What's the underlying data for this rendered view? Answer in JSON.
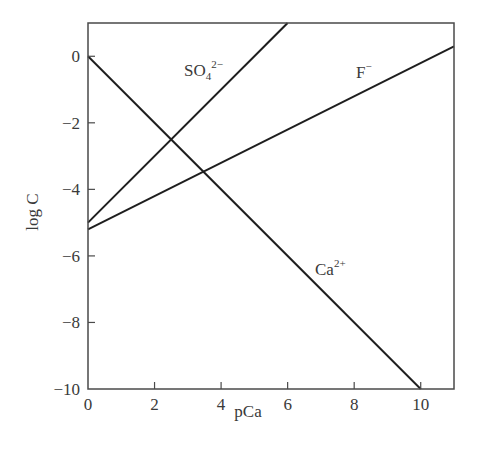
{
  "chart_data": {
    "type": "line",
    "title": "",
    "xlabel": "pCa",
    "ylabel": "log C",
    "xlim": [
      0,
      11
    ],
    "ylim": [
      -10,
      1
    ],
    "grid": false,
    "legend": "inline labels",
    "x_ticks": [
      0,
      2,
      4,
      6,
      8,
      10
    ],
    "x_tick_labels": [
      "0",
      "2",
      "4",
      "6",
      "8",
      "10"
    ],
    "y_ticks": [
      0,
      -2,
      -4,
      -6,
      -8,
      -10
    ],
    "y_tick_labels": [
      "0",
      "−2",
      "−4",
      "−6",
      "−8",
      "−10"
    ],
    "series": [
      {
        "name": "Ca2+",
        "label_base": "Ca",
        "label_sup": "2+",
        "label_sub": "",
        "x": [
          0,
          10
        ],
        "values": [
          0,
          -10
        ],
        "note": "log C = -pCa"
      },
      {
        "name": "SO4 2-",
        "label_base": "SO",
        "label_sub": "4",
        "label_sup": "2−",
        "x": [
          0,
          6
        ],
        "values": [
          -5,
          1
        ],
        "note": "log C = -5 + pCa"
      },
      {
        "name": "F-",
        "label_base": "F",
        "label_sub": "",
        "label_sup": "−",
        "x": [
          0,
          11
        ],
        "values": [
          -5.2,
          0.3
        ],
        "note": "log C = -5.2 + pCa/2"
      }
    ]
  },
  "colors": {
    "line": "#1e1e1e",
    "axis": "#4a4a4a",
    "text": "#3a3a3a",
    "background": "#ffffff"
  }
}
